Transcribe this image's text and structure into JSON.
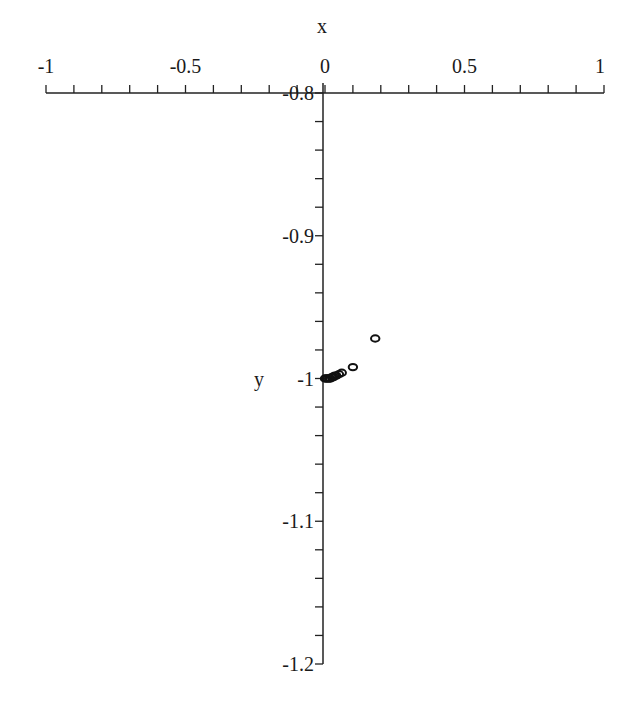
{
  "chart_data": {
    "type": "scatter",
    "title": "",
    "xlabel": "x",
    "ylabel": "y",
    "xlim": [
      -1,
      1
    ],
    "ylim": [
      -1.2,
      -0.8
    ],
    "x_ticks": [
      -1,
      -0.5,
      0,
      0.5,
      1
    ],
    "x_tick_labels": [
      "-1",
      "-0.5",
      "0",
      "0.5",
      "1"
    ],
    "y_ticks": [
      -0.8,
      -0.9,
      -1,
      -1.1,
      -1.2
    ],
    "y_tick_labels": [
      "-0.8",
      "-0.9",
      "-1",
      "-1.1",
      "-1.2"
    ],
    "x_minor_step": 0.1,
    "y_minor_step": 0.02,
    "grid": false,
    "legend": null,
    "marker": "circle-open",
    "series": [
      {
        "name": "points",
        "x": [
          0.0,
          0.005,
          0.01,
          0.015,
          0.02,
          0.025,
          0.03,
          0.035,
          0.04,
          0.05,
          0.06,
          0.1,
          0.18
        ],
        "y": [
          -1.0,
          -1.0,
          -1.0,
          -1.0,
          -1.0,
          -0.999,
          -0.999,
          -0.998,
          -0.998,
          -0.997,
          -0.996,
          -0.992,
          -0.972
        ]
      }
    ]
  }
}
